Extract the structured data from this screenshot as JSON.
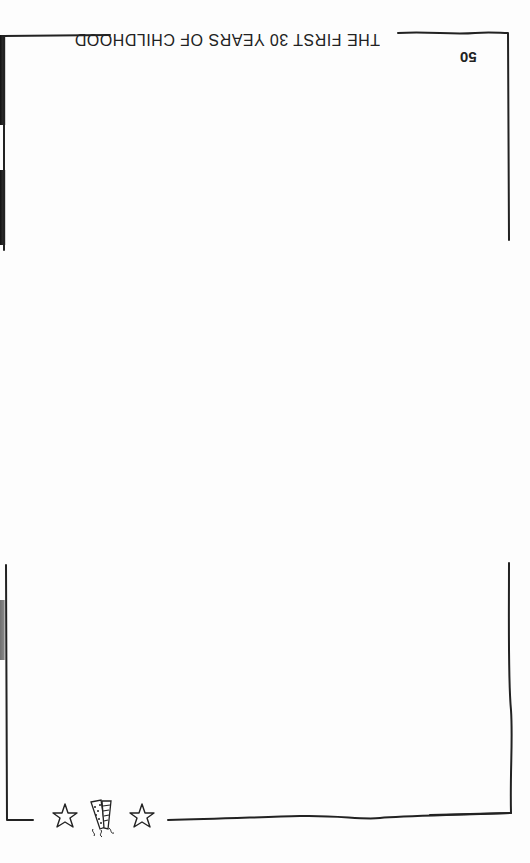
{
  "page": {
    "orientation": "rotated-180",
    "header_title": "THE FIRST 30 YEARS OF CHILDHOOD",
    "page_number": "50"
  },
  "ornaments": {
    "left_star": "star-outline",
    "center_icon": "party-horns",
    "right_star": "star-outline"
  },
  "colors": {
    "background": "#fdfdfd",
    "ink": "#222222"
  }
}
